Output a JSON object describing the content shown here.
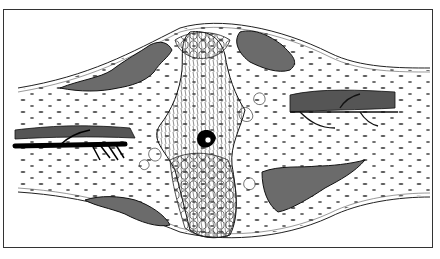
{
  "figure": {
    "colors": {
      "ink": "#1a1a1a",
      "paper": "#ffffff",
      "frame": "#333333",
      "shade": "#6b6b6b"
    },
    "labels": []
  }
}
